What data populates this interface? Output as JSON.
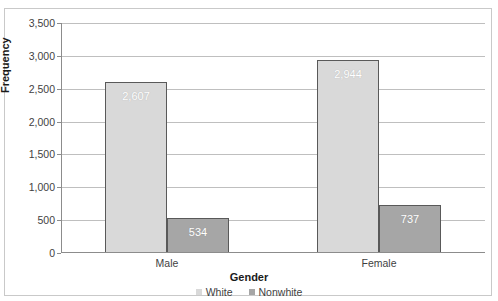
{
  "ghost": {
    "clipped_text": ""
  },
  "chart_data": {
    "type": "bar",
    "title": "",
    "subtitle": "",
    "xlabel": "Gender",
    "ylabel": "Frequency",
    "categories": [
      "Male",
      "Female"
    ],
    "series": [
      {
        "name": "White",
        "color": "#D9D9D9",
        "values": [
          2607,
          2944
        ],
        "value_labels": [
          "2,607",
          "2,944"
        ]
      },
      {
        "name": "Nonwhite",
        "color": "#A6A6A6",
        "values": [
          534,
          737
        ],
        "value_labels": [
          "534",
          "737"
        ]
      }
    ],
    "ylim": [
      0,
      3500
    ],
    "ytick_values": [
      0,
      500,
      1000,
      1500,
      2000,
      2500,
      3000,
      3500
    ],
    "ytick_labels": [
      "0",
      "500",
      "1,000",
      "1,500",
      "2,000",
      "2,500",
      "3,000",
      "3,500"
    ],
    "grid": true,
    "grid_axis": "y",
    "legend_position": "bottom",
    "bar_label_position": "inside-top",
    "bar_label_color": "#FFFFFF",
    "plot_border_color": "#8C8C8C",
    "gridline_color": "#BFBFBF",
    "bar_outline_color": "#595959",
    "background_color": "#FFFFFF"
  }
}
